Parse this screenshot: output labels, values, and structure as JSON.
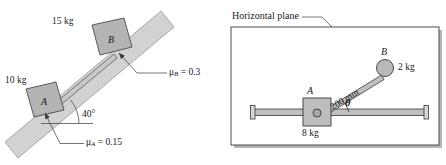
{
  "figure": {
    "colors": {
      "block_fill": "#b4b4b4",
      "incline_fill": "#d2d2d2",
      "rod_fill": "#c0c0c0",
      "sphere_fill": "#b9b9b9",
      "panel_fill": "#ffffff",
      "shadow": "#b0b0b0",
      "stroke": "#3a3a3a",
      "text": "#1a1a1a"
    }
  },
  "left_panel": {
    "name": "inclined-plane-diagram",
    "mass_a_label": "10 kg",
    "mass_b_label": "15 kg",
    "block_a_letter": "A",
    "block_b_letter": "B",
    "angle_label": "40°",
    "mu_a": {
      "symbol": "μ",
      "subscript": "A",
      "equals": " = ",
      "value": "0.15",
      "full": "μA = 0.15"
    },
    "mu_b": {
      "symbol": "μ",
      "subscript": "B",
      "equals": " = ",
      "value": "0.3",
      "full": "μB = 0.3"
    }
  },
  "right_panel": {
    "name": "horizontal-plane-diagram",
    "caption": "Horizontal plane",
    "block_a_letter": "A",
    "sphere_b_letter": "B",
    "mass_block_label": "8 kg",
    "mass_sphere_label": "2 kg",
    "rod_length_label": "200 mm",
    "angle_symbol": "θ"
  }
}
